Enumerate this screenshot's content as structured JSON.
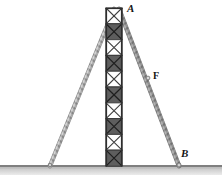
{
  "figure": {
    "background_color": "#ffffff"
  },
  "labels": {
    "apex": "A",
    "force": "F",
    "anchor_right": "B"
  },
  "colors": {
    "ground_line": "#8a8a8a",
    "ground_shadow": "#c9c9c9",
    "cable_light": "#b4b4b4",
    "cable_dark": "#7a7a7a",
    "tower_frame": "#4a4a4a",
    "tower_panel_dark": "#5a5a5a",
    "tower_panel_light": "#ffffff",
    "label_color": "#151515"
  },
  "geometry": {
    "ground_y": 165,
    "tower": {
      "x_left": 106,
      "x_right": 122,
      "y_top": 8,
      "y_bottom": 166,
      "panel_count": 10,
      "panel_pattern": [
        "light",
        "dark",
        "light",
        "dark",
        "light",
        "dark",
        "light",
        "dark",
        "light",
        "dark"
      ]
    },
    "cable_left": {
      "x1": 114,
      "y1": 8,
      "x2": 50,
      "y2": 166
    },
    "cable_right": {
      "x1": 119,
      "y1": 8,
      "x2": 179,
      "y2": 166
    },
    "force_marker": {
      "x": 148,
      "y": 78
    }
  }
}
